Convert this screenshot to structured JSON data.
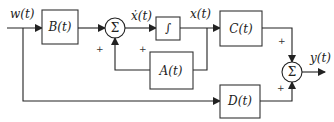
{
  "diagram": {
    "type": "state-space block diagram",
    "signals": {
      "input": "w(t)",
      "state_derivative": "ẋ(t)",
      "state": "x(t)",
      "output": "y(t)"
    },
    "blocks": {
      "B": "B(t)",
      "integrator": "∫",
      "A": "A(t)",
      "C": "C(t)",
      "D": "D(t)"
    },
    "summers": {
      "sum1": {
        "symbol": "Σ",
        "signs": [
          "+",
          "+"
        ]
      },
      "sum2": {
        "symbol": "Σ",
        "signs": [
          "+",
          "+"
        ]
      }
    },
    "colors": {
      "line": "#222222",
      "background": "#ffffff"
    }
  }
}
